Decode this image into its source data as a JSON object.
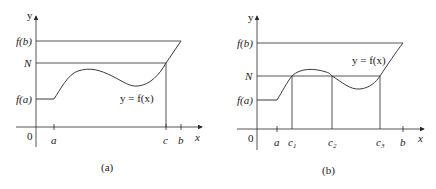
{
  "panels": [
    {
      "id": "a",
      "caption": "(a)",
      "y_axis_label": "y",
      "x_axis_label": "x",
      "origin_label": "0",
      "y_labels": {
        "fb": "f(b)",
        "N": "N",
        "fa": "f(a)"
      },
      "x_labels": {
        "a": "a",
        "c": "c",
        "b": "b"
      },
      "curve_label": "y = f(x)"
    },
    {
      "id": "b",
      "caption": "(b)",
      "y_axis_label": "y",
      "x_axis_label": "x",
      "origin_label": "0",
      "y_labels": {
        "fb": "f(b)",
        "N": "N",
        "fa": "f(a)"
      },
      "x_labels": {
        "a": "a",
        "c1": "c",
        "c1_sub": "1",
        "c2": "c",
        "c2_sub": "2",
        "c3": "c",
        "c3_sub": "3",
        "b": "b"
      },
      "curve_label": "y = f(x)"
    }
  ],
  "colors": {
    "line": "#2a2a2a",
    "text": "#222222",
    "background": "#ffffff"
  }
}
